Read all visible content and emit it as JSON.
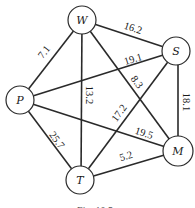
{
  "diagram": {
    "type": "weighted-graph",
    "caption": "Fig. 10.5",
    "nodes": [
      {
        "id": "W",
        "label": "W",
        "x": 82,
        "y": 20
      },
      {
        "id": "S",
        "label": "S",
        "x": 176,
        "y": 51
      },
      {
        "id": "P",
        "label": "P",
        "x": 20,
        "y": 100
      },
      {
        "id": "M",
        "label": "M",
        "x": 178,
        "y": 151
      },
      {
        "id": "T",
        "label": "T",
        "x": 80,
        "y": 180
      }
    ],
    "edges": [
      {
        "from": "W",
        "to": "S",
        "weight": "16.2"
      },
      {
        "from": "W",
        "to": "P",
        "weight": "7.1"
      },
      {
        "from": "W",
        "to": "T",
        "weight": "13.2"
      },
      {
        "from": "W",
        "to": "M",
        "weight": "8.3"
      },
      {
        "from": "P",
        "to": "S",
        "weight": "19.1"
      },
      {
        "from": "S",
        "to": "T",
        "weight": "17.2"
      },
      {
        "from": "S",
        "to": "M",
        "weight": "18.1"
      },
      {
        "from": "P",
        "to": "M",
        "weight": "19.5"
      },
      {
        "from": "P",
        "to": "T",
        "weight": "25.7"
      },
      {
        "from": "T",
        "to": "M",
        "weight": "5.2"
      }
    ]
  }
}
